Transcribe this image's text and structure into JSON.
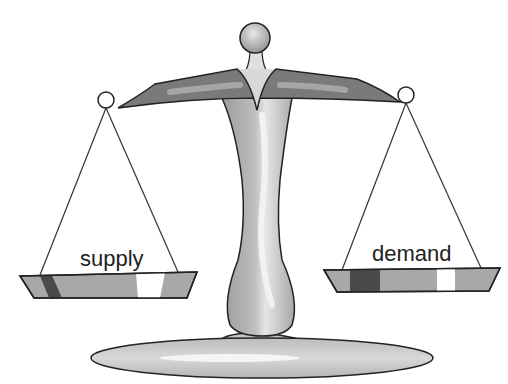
{
  "illustration": {
    "subject": "balance scale",
    "left_pan": {
      "label": "supply"
    },
    "right_pan": {
      "label": "demand"
    }
  },
  "colors": {
    "outline": "#222222",
    "beam": "#777777",
    "beam_highlight": "#9a9a9a",
    "column": "#b0b0b0",
    "column_highlight": "#dcdcdc",
    "base": "#c8c8c8",
    "pan_fill": "#a8a8a8",
    "pan_dark": "#4a4a4a",
    "pan_white": "#ffffff"
  }
}
